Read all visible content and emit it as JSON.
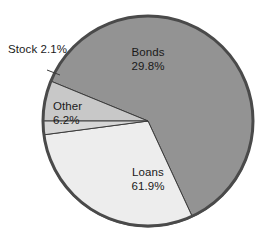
{
  "chart_data": {
    "type": "pie",
    "title": "",
    "subtitle": "",
    "xlabel": "",
    "ylabel": "",
    "legend_position": "none",
    "grid": false,
    "units": "percent",
    "total": 100.0,
    "categories": [
      "Bonds",
      "Loans",
      "Other",
      "Stock"
    ],
    "values": [
      29.8,
      61.9,
      6.2,
      2.1
    ],
    "slices": [
      {
        "name": "Bonds",
        "value": 29.8,
        "value_label": "29.8%",
        "color": "#ededed",
        "label_placement": "inside",
        "start_angle_deg": 187.6,
        "end_angle_deg": 294.9
      },
      {
        "name": "Loans",
        "value": 61.9,
        "value_label": "61.9%",
        "color": "#939393",
        "label_placement": "inside",
        "start_angle_deg": 294.9,
        "end_angle_deg": 157.7
      },
      {
        "name": "Other",
        "value": 6.2,
        "value_label": "6.2%",
        "color": "#c8c8c8",
        "label_placement": "inside",
        "start_angle_deg": 157.7,
        "end_angle_deg": 180.0
      },
      {
        "name": "Stock",
        "value": 2.1,
        "value_label": "2.1%",
        "color": "#d6d6d6",
        "label_placement": "callout",
        "start_angle_deg": 180.0,
        "end_angle_deg": 187.6
      }
    ],
    "annotations": [
      {
        "text": "Stock",
        "kind": "leader-line-label"
      }
    ]
  },
  "labels": {
    "bonds": {
      "name": "Bonds",
      "value": "29.8%"
    },
    "loans": {
      "name": "Loans",
      "value": "61.9%"
    },
    "other": {
      "name": "Other",
      "value": "6.2%"
    },
    "stock": {
      "name": "Stock",
      "value": "2.1%"
    }
  },
  "style": {
    "background": "#ffffff",
    "rim_color": "#4a4a4a",
    "divider_color": "#3c3c3c",
    "text_color": "#1a1a1a",
    "leader_line_color": "#3c3c3c"
  }
}
